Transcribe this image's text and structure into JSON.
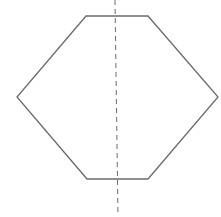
{
  "diagram": {
    "shape": "hexagon",
    "stroke_color": "#6b6b6b",
    "axis_color": "#6b6b6b",
    "vertices": [
      [
        86,
        16
      ],
      [
        148,
        16
      ],
      [
        218,
        97
      ],
      [
        148,
        179
      ],
      [
        87,
        179
      ],
      [
        17,
        97
      ]
    ],
    "symmetry_axis": {
      "x1": 115,
      "y1": 0,
      "x2": 118,
      "y2": 216,
      "style": "dashed"
    }
  }
}
